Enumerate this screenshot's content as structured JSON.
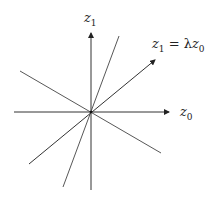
{
  "diagram": {
    "axes": {
      "vertical_label": {
        "base": "z",
        "sub": "1"
      },
      "horizontal_label": {
        "base": "z",
        "sub": "0"
      }
    },
    "highlighted_line_label": {
      "lhs": "z",
      "lhs_sub": "1",
      "eq": " = λ",
      "rhs": "z",
      "rhs_sub": "0"
    },
    "lines": [
      {
        "name": "z1-axis",
        "from": [
          91,
          190
        ],
        "to": [
          91,
          32
        ],
        "arrow": true
      },
      {
        "name": "z0-axis",
        "from": [
          14,
          112
        ],
        "to": [
          170,
          112
        ],
        "arrow": true
      },
      {
        "name": "steep-line",
        "from": [
          63,
          187
        ],
        "to": [
          119,
          36
        ],
        "arrow": false
      },
      {
        "name": "negative-slope-line",
        "from": [
          20,
          71
        ],
        "to": [
          161,
          153
        ],
        "arrow": false
      },
      {
        "name": "eigen-line",
        "from": [
          29,
          164
        ],
        "to": [
          156,
          59
        ],
        "arrow": true
      }
    ],
    "colors": {
      "line": "#333333",
      "background": "#ffffff"
    }
  }
}
